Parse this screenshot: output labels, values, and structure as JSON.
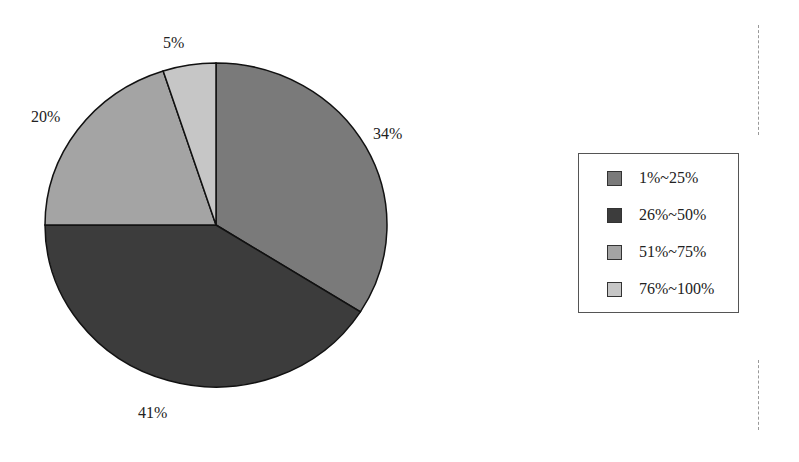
{
  "chart_data": {
    "type": "pie",
    "title": "",
    "categories": [
      "1%~25%",
      "26%~50%",
      "51%~75%",
      "76%~100%"
    ],
    "values": [
      34,
      41,
      20,
      5
    ],
    "labels": [
      "34%",
      "41%",
      "20%",
      "5%"
    ],
    "colors": [
      "#7a7a7a",
      "#3c3c3c",
      "#a4a4a4",
      "#c6c6c6"
    ],
    "start_angle_deg": 90,
    "direction": "clockwise",
    "legend": {
      "position": "right",
      "entries": [
        "1%~25%",
        "26%~50%",
        "51%~75%",
        "76%~100%"
      ]
    }
  },
  "legend": {
    "items": [
      {
        "label": "1%~25%",
        "color": "#7a7a7a"
      },
      {
        "label": "26%~50%",
        "color": "#3c3c3c"
      },
      {
        "label": "51%~75%",
        "color": "#a4a4a4"
      },
      {
        "label": "76%~100%",
        "color": "#c6c6c6"
      }
    ]
  },
  "slice_labels": {
    "s1": "34%",
    "s2": "41%",
    "s3": "20%",
    "s4": "5%"
  }
}
